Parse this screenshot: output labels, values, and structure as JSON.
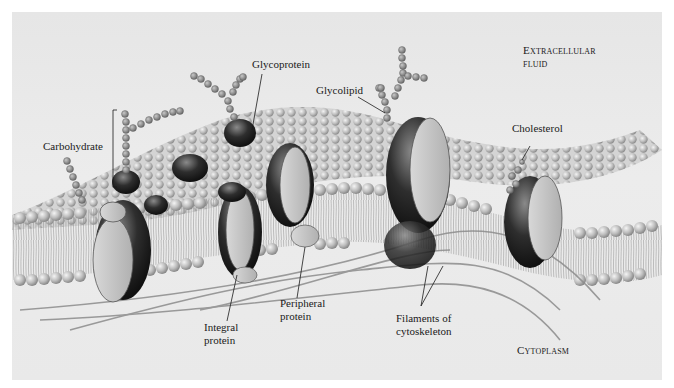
{
  "figure": {
    "regions": {
      "extracellular": {
        "line1": "Extracellular",
        "line2": "fluid"
      },
      "cytoplasm": "Cytoplasm"
    },
    "labels": {
      "carbohydrate": "Carbohydrate",
      "glycoprotein": "Glycoprotein",
      "glycolipid": "Glycolipid",
      "cholesterol": "Cholesterol",
      "integral_protein": {
        "line1": "Integral",
        "line2": "protein"
      },
      "peripheral_protein": {
        "line1": "Peripheral",
        "line2": "protein"
      },
      "filaments": {
        "line1": "Filaments of",
        "line2": "cytoskeleton"
      }
    },
    "colors": {
      "background": "#e8e8e8",
      "margin": "#ffffff",
      "phospholipid_head": "#bdbdbd",
      "protein_light": "#c8c8c8",
      "protein_dark": "#2a2a2a",
      "carbohydrate_bead": "#9a9a9a",
      "text": "#1a1a1a"
    }
  }
}
